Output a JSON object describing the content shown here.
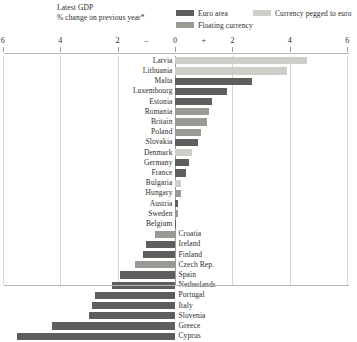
{
  "header": {
    "title": "Latest GDP",
    "subtitle": "% change on previous year*"
  },
  "legend": {
    "items": [
      {
        "key": "euro",
        "label": "Euro area",
        "color": "#5e5e5c"
      },
      {
        "key": "pegged",
        "label": "Currency pegged to euro",
        "color": "#cfcdc8"
      },
      {
        "key": "floating",
        "label": "Floating currency",
        "color": "#9a9a95"
      }
    ]
  },
  "axis": {
    "ticks": [
      {
        "label": "6",
        "value": -6
      },
      {
        "label": "4",
        "value": -4
      },
      {
        "label": "2",
        "value": -2
      },
      {
        "label": "0",
        "value": 0
      },
      {
        "label": "2",
        "value": 2
      },
      {
        "label": "4",
        "value": 4
      },
      {
        "label": "6",
        "value": 6
      }
    ],
    "sign_negative": "–",
    "sign_positive": "+",
    "min": -6,
    "max": 6
  },
  "chart_data": {
    "type": "bar",
    "orientation": "horizontal",
    "title": "Latest GDP",
    "subtitle": "% change on previous year*",
    "xlabel": "% change on previous year",
    "ylabel": "",
    "xlim": [
      -6,
      6
    ],
    "grid": true,
    "legend_position": "top-right",
    "categories": [
      "Latvia",
      "Lithuania",
      "Malta",
      "Luxembourg",
      "Estonia",
      "Romania",
      "Britain",
      "Poland",
      "Slovakia",
      "Denmark",
      "Germany",
      "France",
      "Bulgaria",
      "Hungary",
      "Austria",
      "Sweden",
      "Belgium",
      "Croatia",
      "Ireland",
      "Finland",
      "Czech Rep.",
      "Spain",
      "Netherlands",
      "Portugal",
      "Italy",
      "Slovenia",
      "Greece",
      "Cyprus"
    ],
    "values": [
      4.6,
      3.9,
      2.7,
      1.8,
      1.3,
      1.2,
      1.1,
      0.9,
      0.8,
      0.6,
      0.5,
      0.4,
      0.2,
      0.2,
      0.1,
      0.1,
      0.0,
      -0.7,
      -1.0,
      -1.1,
      -1.4,
      -1.9,
      -2.2,
      -2.8,
      -2.9,
      -3.0,
      -4.3,
      -5.5
    ],
    "series_group": [
      "pegged",
      "pegged",
      "euro",
      "euro",
      "euro",
      "floating",
      "floating",
      "floating",
      "euro",
      "pegged",
      "euro",
      "euro",
      "pegged",
      "floating",
      "euro",
      "floating",
      "euro",
      "floating",
      "euro",
      "euro",
      "floating",
      "euro",
      "euro",
      "euro",
      "euro",
      "euro",
      "euro",
      "euro"
    ],
    "group_colors": {
      "euro": "#5e5e5c",
      "pegged": "#cfcdc8",
      "floating": "#9a9a95"
    }
  }
}
